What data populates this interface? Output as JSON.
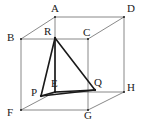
{
  "figure": {
    "type": "geometry-diagram",
    "background_color": "#ffffff",
    "canvas": {
      "width": 141,
      "height": 125
    },
    "styles": {
      "cube_edge_color": "#6b6b6b",
      "cube_edge_width": 0.8,
      "inner_edge_color": "#1a1a1a",
      "inner_edge_width": 1.6,
      "label_color": "#1a1a1a",
      "label_font_size": 11
    },
    "vertices": [
      {
        "name": "A",
        "label": "A",
        "x": 55,
        "y": 17,
        "label_x": 51,
        "label_y": 3,
        "kind": "cube-vertex"
      },
      {
        "name": "B",
        "label": "B",
        "x": 21,
        "y": 39,
        "label_x": 7,
        "label_y": 32,
        "kind": "cube-vertex"
      },
      {
        "name": "C",
        "label": "C",
        "x": 88,
        "y": 39,
        "label_x": 83,
        "label_y": 27,
        "kind": "cube-vertex"
      },
      {
        "name": "D",
        "label": "D",
        "x": 124,
        "y": 17,
        "label_x": 127,
        "label_y": 3,
        "kind": "cube-vertex"
      },
      {
        "name": "E",
        "label": "E",
        "x": 55,
        "y": 92,
        "label_x": 51,
        "label_y": 78,
        "kind": "cube-vertex"
      },
      {
        "name": "F",
        "label": "F",
        "x": 21,
        "y": 110,
        "label_x": 7,
        "label_y": 107,
        "kind": "cube-vertex"
      },
      {
        "name": "G",
        "label": "G",
        "x": 88,
        "y": 110,
        "label_x": 84,
        "label_y": 110,
        "kind": "cube-vertex"
      },
      {
        "name": "H",
        "label": "H",
        "x": 124,
        "y": 92,
        "label_x": 127,
        "label_y": 82,
        "kind": "cube-vertex"
      },
      {
        "name": "P",
        "label": "P",
        "x": 41,
        "y": 96,
        "label_x": 31,
        "label_y": 87,
        "kind": "inner-point"
      },
      {
        "name": "Q",
        "label": "Q",
        "x": 95,
        "y": 90,
        "label_x": 94,
        "label_y": 77,
        "kind": "inner-point"
      },
      {
        "name": "R",
        "label": "R",
        "x": 55,
        "y": 38,
        "label_x": 44,
        "label_y": 26,
        "kind": "inner-point"
      }
    ],
    "cube_edges": [
      {
        "name": "edge-A-D",
        "from": "A",
        "to": "D"
      },
      {
        "name": "edge-A-B",
        "from": "A",
        "to": "B"
      },
      {
        "name": "edge-B-C",
        "from": "B",
        "to": "C"
      },
      {
        "name": "edge-C-D",
        "from": "C",
        "to": "D"
      },
      {
        "name": "edge-B-F",
        "from": "B",
        "to": "F"
      },
      {
        "name": "edge-C-G",
        "from": "C",
        "to": "G"
      },
      {
        "name": "edge-D-H",
        "from": "D",
        "to": "H"
      },
      {
        "name": "edge-A-E",
        "from": "A",
        "to": "E"
      },
      {
        "name": "edge-F-G",
        "from": "F",
        "to": "G"
      },
      {
        "name": "edge-G-H",
        "from": "G",
        "to": "H"
      },
      {
        "name": "edge-E-F",
        "from": "E",
        "to": "F"
      },
      {
        "name": "edge-E-H",
        "from": "E",
        "to": "H"
      }
    ],
    "inner_edges": [
      {
        "name": "edge-R-P",
        "from": "R",
        "to": "P"
      },
      {
        "name": "edge-R-Q",
        "from": "R",
        "to": "Q"
      },
      {
        "name": "edge-R-E",
        "from": "R",
        "to": "E"
      },
      {
        "name": "edge-P-E",
        "from": "P",
        "to": "E"
      },
      {
        "name": "edge-E-Q",
        "from": "E",
        "to": "Q"
      },
      {
        "name": "edge-P-Q",
        "from": "P",
        "to": "Q"
      }
    ]
  }
}
